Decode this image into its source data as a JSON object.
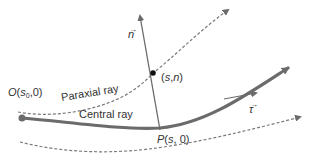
{
  "diagram": {
    "type": "ray-coordinate-system",
    "colors": {
      "background": "#ffffff",
      "central_ray": "#6b6b6b",
      "dashed_rays": "#7a7a7a",
      "normal_line": "#6b6b6b",
      "text": "#333333",
      "point": "#111111"
    },
    "labels": {
      "normal_vector": "n",
      "tangent_vector": "τ",
      "point_sn": "(s,n)",
      "origin_prefix": "O(s",
      "origin_sub": "0",
      "origin_suffix": ",0)",
      "paraxial_ray": "Paraxial ray",
      "central_ray": "Central ray",
      "point_p_italic": "P",
      "point_p_rest": "(s, 0)"
    },
    "vector_bar": "→",
    "elements": [
      {
        "name": "central-ray",
        "style": "solid-thick",
        "label": "Central ray"
      },
      {
        "name": "paraxial-ray",
        "style": "dashed",
        "label": "Paraxial ray"
      },
      {
        "name": "lower-ray",
        "style": "dashed",
        "label": ""
      },
      {
        "name": "normal-vector",
        "style": "solid-thin-arrow",
        "label": "n"
      },
      {
        "name": "tangent-vector",
        "style": "solid-thin-arrow",
        "label": "τ"
      }
    ]
  }
}
